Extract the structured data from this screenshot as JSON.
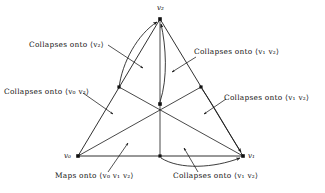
{
  "figure": {
    "type": "simplex-collapse-diagram",
    "vertices": [
      {
        "id": "v0",
        "label": "v",
        "sub": "0",
        "x": 78,
        "y": 156
      },
      {
        "id": "v1",
        "label": "v",
        "sub": "1",
        "x": 243,
        "y": 156
      },
      {
        "id": "v2",
        "label": "v",
        "sub": "2",
        "x": 160,
        "y": 19
      }
    ],
    "midpoints": [
      {
        "id": "m02",
        "x": 119,
        "y": 87
      },
      {
        "id": "m12",
        "x": 201,
        "y": 87
      },
      {
        "id": "m01",
        "x": 160,
        "y": 156
      }
    ],
    "centroid": {
      "id": "c",
      "x": 160,
      "y": 104
    },
    "annotations": [
      {
        "id": "a1",
        "text": "Collapses onto ",
        "target": "⟨v₂⟩",
        "x": 30,
        "y": 45
      },
      {
        "id": "a2",
        "text": "Collapses onto ",
        "target": "⟨v₁ v₂⟩",
        "x": 192,
        "y": 52
      },
      {
        "id": "a3",
        "text": "Collapses onto ",
        "target": "⟨v₀ v₂⟩",
        "x": 6,
        "y": 92
      },
      {
        "id": "a4",
        "text": "Collapses onto ",
        "target": "⟨v₁ v₂⟩",
        "x": 222,
        "y": 97
      },
      {
        "id": "a5",
        "text": "Maps onto ",
        "target": "⟨v₀ v₁ v₂⟩",
        "x": 57,
        "y": 176
      },
      {
        "id": "a6",
        "text": "Collapses onto ",
        "target": "⟨v₁ v₂⟩",
        "x": 175,
        "y": 176
      }
    ]
  },
  "labels": {
    "collapses": "Collapses onto",
    "maps": "Maps onto",
    "v2_word": "⟨v₂⟩",
    "v1v2_word": "⟨v₁ v₂⟩",
    "v0v2_word": "⟨v₀ v₂⟩",
    "v0v1v2_word": "⟨v₀ v₁ v₂⟩",
    "label_top_left": "Collapses onto ⟨v₂⟩",
    "label_top_right": "Collapses onto ⟨v₁ v₂⟩",
    "label_mid_left": "Collapses onto ⟨v₀ v₂⟩",
    "label_mid_right": "Collapses onto ⟨v₁ v₂⟩",
    "label_bottom_left": "Maps onto ⟨v₀ v₁ v₂⟩",
    "label_bottom_right": "Collapses onto ⟨v₁ v₂⟩",
    "vertex_v0": "v₀",
    "vertex_v1": "v₁",
    "vertex_v2": "v₂"
  },
  "colors": {
    "ink": "#111111",
    "background": "#ffffff",
    "line": "#1a1a1a"
  }
}
